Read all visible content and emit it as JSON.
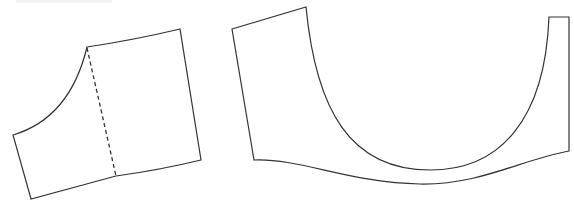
{
  "diagram": {
    "type": "sewing-pattern-pieces",
    "stroke_color": "#333333",
    "background": "#ffffff",
    "pieces": [
      {
        "id": "piece-left",
        "description": "quadrilateral pattern piece with curved armhole/neck edge and dashed fold/grain line",
        "outline_path": "M87,47 Q134,40 180,29 L201,160 Q160,170 116,176 L31,199 L13,135 Q70,118 87,47 Z",
        "dashed_line": {
          "x1": 87,
          "y1": 48,
          "x2": 116,
          "y2": 176
        }
      },
      {
        "id": "piece-right",
        "description": "U-shaped pattern piece with deep curved cut-out and wavy bottom edge",
        "outline_path": "M232,29 L306,7 C316,110 350,170 430,170 C500,170 545,120 549,17 L569,17 L569,151 C520,160 480,185 420,184 C350,183 300,158 254,160 Z"
      }
    ]
  }
}
